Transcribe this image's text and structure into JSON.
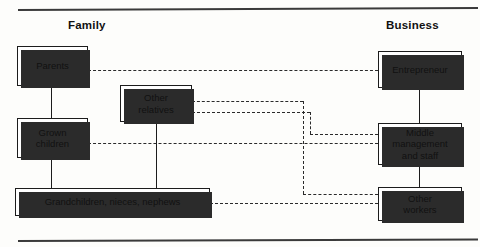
{
  "diagram": {
    "headings": {
      "family": "Family",
      "business": "Business"
    },
    "colors": {
      "line": "#1c1c1c",
      "dashed_line": "#2a2a2a",
      "box_fill": "#ffffff",
      "shadow": "#2b2b2b",
      "text": "#111111",
      "background": "#fdfdfb"
    },
    "nodes": [
      {
        "id": "parents",
        "column": "family",
        "label": "Parents"
      },
      {
        "id": "grown-children",
        "column": "family",
        "label": "Grown\nchildren",
        "line1": "Grown",
        "line2": "children"
      },
      {
        "id": "other-relatives",
        "column": "family",
        "label": "Other\nrelatives",
        "line1": "Other",
        "line2": "relatives"
      },
      {
        "id": "grandchildren",
        "column": "family",
        "label": "Grandchildren, nieces, nephews"
      },
      {
        "id": "entrepreneur",
        "column": "business",
        "label": "Entrepreneur"
      },
      {
        "id": "middle-management",
        "column": "business",
        "label": "Middle\nmanagement\nand staff",
        "line1": "Middle",
        "line2": "management",
        "line3": "and staff"
      },
      {
        "id": "other-workers",
        "column": "business",
        "label": "Other\nworkers",
        "line1": "Other",
        "line2": "workers"
      }
    ],
    "connections": [
      {
        "from": "parents",
        "to": "entrepreneur",
        "style": "dashed"
      },
      {
        "from": "parents",
        "to": "grown-children",
        "style": "solid"
      },
      {
        "from": "grown-children",
        "to": "grandchildren",
        "style": "solid"
      },
      {
        "from": "other-relatives",
        "to": "grandchildren",
        "style": "solid"
      },
      {
        "from": "other-relatives",
        "to": "middle-management",
        "style": "dashed"
      },
      {
        "from": "other-relatives",
        "to": "other-workers",
        "style": "dashed"
      },
      {
        "from": "grown-children",
        "to": "middle-management",
        "style": "dashed"
      },
      {
        "from": "grandchildren",
        "to": "other-workers",
        "style": "dashed"
      },
      {
        "from": "entrepreneur",
        "to": "middle-management",
        "style": "solid"
      },
      {
        "from": "middle-management",
        "to": "other-workers",
        "style": "solid"
      }
    ]
  }
}
